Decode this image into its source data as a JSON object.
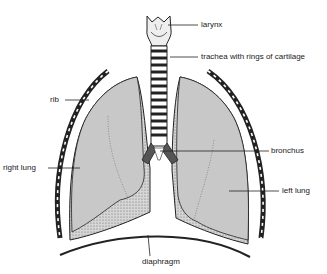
{
  "diagram": {
    "labels": {
      "larynx": "larynx",
      "trachea": "trachea with rings of cartilage",
      "rib": "rib",
      "bronchus": "bronchus",
      "right_lung": "right lung",
      "left_lung": "left lung",
      "diaphragm": "diaphragm"
    },
    "colors": {
      "lung_fill": "#c8c8c8",
      "stipple": "#a8a8a8",
      "outline": "#2a2a2a",
      "background": "#ffffff"
    }
  }
}
